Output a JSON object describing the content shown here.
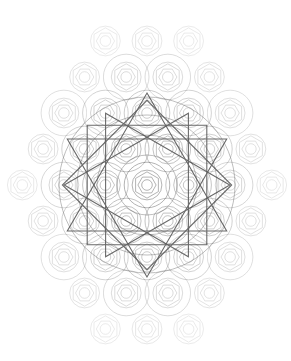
{
  "image": {
    "subject": "sacred geometry pattern",
    "description": "Hexagonal lattice of concentric circles and hexagons fading outward, with a central twelve-pointed star formed by overlapping triangles and squares",
    "background_color": "#ffffff",
    "line_color": "#555555",
    "faint_line_color": "#9a9a9a"
  }
}
